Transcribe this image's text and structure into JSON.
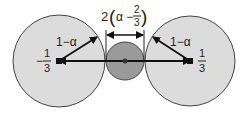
{
  "diagram": {
    "colors": {
      "large_circle_fill": "#dcdcdc",
      "small_circle_fill": "#9a9a9a",
      "stroke": "#444444",
      "arrow": "#111111",
      "background": "#ffffff"
    },
    "left_circle": {
      "center_label_sign": "−",
      "center_label_num": "1",
      "center_label_den": "3",
      "radius_label": "1−α"
    },
    "right_circle": {
      "center_label_num": "1",
      "center_label_den": "3",
      "radius_label": "1−α"
    },
    "middle_circle": {
      "width_label_prefix": "2",
      "width_label_open": "(",
      "width_label_alpha": "α −",
      "width_label_num": "2",
      "width_label_den": "3",
      "width_label_close": ")"
    }
  }
}
